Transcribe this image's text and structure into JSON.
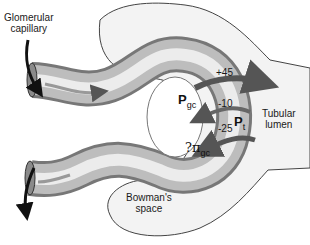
{
  "labels": {
    "glomerular_capillary": "Glomerular\ncapillary",
    "glomerular_line1": "Glomerular",
    "glomerular_line2": "capillary",
    "bowmans_line1": "Bowman's",
    "bowmans_line2": "space",
    "tubular_line1": "Tubular",
    "tubular_line2": "lumen"
  },
  "forces": [
    {
      "symbol": "P",
      "subscript": "gc",
      "value": "+45"
    },
    {
      "symbol": "P",
      "subscript": "t",
      "value": "-10"
    },
    {
      "symbol": "?π",
      "subscript": "gc",
      "value": "-25"
    }
  ],
  "colors": {
    "capillary_light": "#e8e8e8",
    "capillary_dark": "#7a7a7a",
    "bowman_fill": "#f2f2f2",
    "outline": "#444444",
    "arrow_dark": "#555555",
    "arrow_light": "#bdbdbd"
  }
}
